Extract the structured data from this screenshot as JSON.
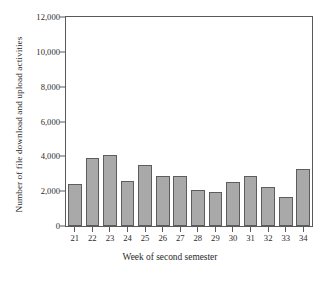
{
  "chart_data": {
    "type": "bar",
    "title": "",
    "xlabel": "Week of second semester",
    "ylabel": "Number of file download and upload activities",
    "categories": [
      "21",
      "22",
      "23",
      "24",
      "25",
      "26",
      "27",
      "28",
      "29",
      "30",
      "31",
      "32",
      "33",
      "34"
    ],
    "values": [
      2400,
      3900,
      4050,
      2600,
      3500,
      2850,
      2880,
      2050,
      1950,
      2550,
      2900,
      2250,
      1650,
      3250
    ],
    "ylim": [
      0,
      12000
    ],
    "ytick_values": [
      0,
      2000,
      4000,
      6000,
      8000,
      10000,
      12000
    ],
    "ytick_labels": [
      "0",
      "2,000",
      "4,000",
      "6,000",
      "8,000",
      "10,000",
      "12,000"
    ],
    "grid": false,
    "legend": false,
    "legend_position": "none",
    "bar_fill_color": "#a9a9a9",
    "bar_edge_color": "#5d5d5d",
    "axis_color": "#5a5a5a",
    "background_color": "#ffffff"
  }
}
